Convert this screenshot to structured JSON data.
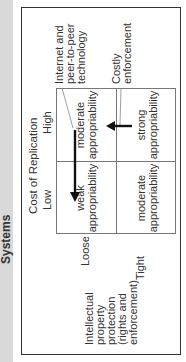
{
  "header": {
    "title": "Systems"
  },
  "column_axis": {
    "title": "Cost of Replication",
    "low_label": "Low",
    "high_label": "High"
  },
  "row_axis": {
    "title_lines": [
      "Intellectual",
      "property",
      "protection",
      "(rights and",
      "enforcement)"
    ],
    "loose_label": "Loose",
    "tight_label": "Tight"
  },
  "cells": {
    "loose_low": [
      "weak",
      "appropriability"
    ],
    "loose_high": [
      "moderate",
      "appropriability"
    ],
    "tight_low": [
      "moderate",
      "appropriability"
    ],
    "tight_high": [
      "strong",
      "appropriability"
    ]
  },
  "annotations": {
    "internet": [
      "Internet and",
      "peer-to-peer",
      "technology"
    ],
    "costly": [
      "Costly",
      "enforcement"
    ]
  },
  "colors": {
    "strip": "#d9d9d9",
    "border": "#333333",
    "grid": "#777777",
    "arrow": "#111111"
  }
}
